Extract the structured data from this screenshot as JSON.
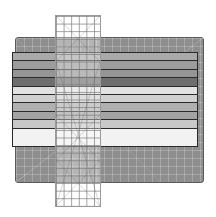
{
  "scene": {
    "description": "Quilting ruler over fabric strips on a cutting mat",
    "mat_color": "#8e8e8e",
    "strips": [
      {
        "color": "#a9a9a9",
        "height": 8
      },
      {
        "color": "#9c9c9c",
        "height": 8
      },
      {
        "color": "#959595",
        "height": 8
      },
      {
        "color": "#6e6e6e",
        "height": 8
      },
      {
        "color": "#e2e2e2",
        "height": 8
      },
      {
        "color": "#d0d0d0",
        "height": 8
      },
      {
        "color": "#b0b0b0",
        "height": 8
      },
      {
        "color": "#a3a3a3",
        "height": 8
      },
      {
        "color": "#c8c8c8",
        "height": 8
      },
      {
        "color": "#f2f2f2",
        "height": 19
      }
    ]
  }
}
